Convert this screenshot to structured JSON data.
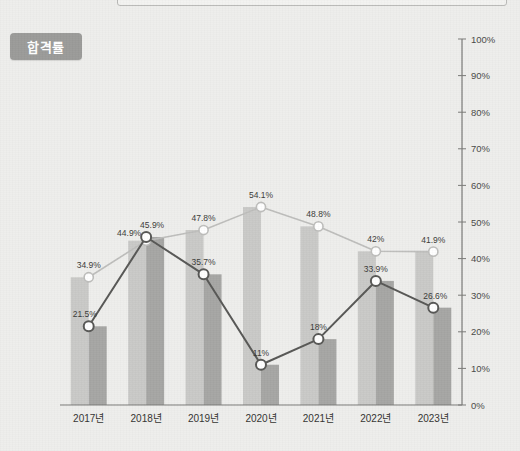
{
  "badge": {
    "label": "합격률"
  },
  "chart_data": {
    "type": "line",
    "title": "합격률",
    "xlabel": "",
    "ylabel": "",
    "ylim": [
      0,
      100
    ],
    "yticks": [
      "0%",
      "10%",
      "20%",
      "30%",
      "40%",
      "50%",
      "60%",
      "70%",
      "80%",
      "90%",
      "100%"
    ],
    "ytick_values": [
      0,
      10,
      20,
      30,
      40,
      50,
      60,
      70,
      80,
      90,
      100
    ],
    "grid": false,
    "legend": "none",
    "categories": [
      "2017년",
      "2018년",
      "2019년",
      "2020년",
      "2021년",
      "2022년",
      "2023년"
    ],
    "series": [
      {
        "name": "light-series",
        "color": "#bdbdbb",
        "values": [
          34.9,
          44.9,
          47.8,
          54.1,
          48.8,
          42.0,
          41.9
        ],
        "labels": [
          "34.9%",
          "44.9%",
          "47.8%",
          "54.1%",
          "48.8%",
          "42%",
          "41.9%"
        ]
      },
      {
        "name": "dark-series",
        "color": "#575755",
        "values": [
          21.5,
          45.9,
          35.7,
          11.0,
          18.0,
          33.9,
          26.6
        ],
        "labels": [
          "21.5%",
          "45.9%",
          "35.7%",
          "11%",
          "18%",
          "33.9%",
          "26.6%"
        ]
      }
    ],
    "bars": [
      {
        "name": "light-bars",
        "color": "#c9c9c7",
        "values": [
          34.9,
          44.9,
          47.8,
          54.1,
          48.8,
          42.0,
          41.9
        ]
      },
      {
        "name": "dark-bars",
        "color": "#a6a6a4",
        "values": [
          21.5,
          45.9,
          35.7,
          11.0,
          18.0,
          33.9,
          26.6
        ]
      }
    ],
    "colors": {
      "background": "#eeeeec",
      "axis": "#7a7a78",
      "badge": "#9b9b99",
      "marker_fill": "#ffffff"
    }
  }
}
